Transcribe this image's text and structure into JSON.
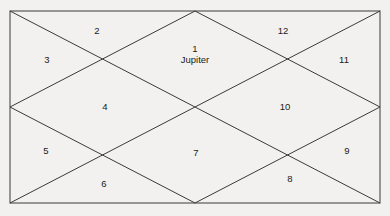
{
  "chart": {
    "type": "north-indian-vedic-birth-chart",
    "title": "",
    "background_color": "#f2f1ef",
    "line_color": "#3a3a3a",
    "text_color": "#1a1a1a",
    "frame": {
      "x1": 10,
      "y1": 11,
      "x2": 380,
      "y2": 203
    },
    "center": {
      "x": 195,
      "y": 107
    },
    "houses": [
      {
        "number": "1",
        "planets": "Jupiter",
        "label_x": 195,
        "label_y": 54
      },
      {
        "number": "2",
        "planets": "",
        "label_x": 97,
        "label_y": 30
      },
      {
        "number": "3",
        "planets": "",
        "label_x": 47,
        "label_y": 59
      },
      {
        "number": "4",
        "planets": "",
        "label_x": 105,
        "label_y": 106
      },
      {
        "number": "5",
        "planets": "",
        "label_x": 46,
        "label_y": 150
      },
      {
        "number": "6",
        "planets": "",
        "label_x": 104,
        "label_y": 183
      },
      {
        "number": "7",
        "planets": "",
        "label_x": 196,
        "label_y": 152
      },
      {
        "number": "8",
        "planets": "",
        "label_x": 290,
        "label_y": 178
      },
      {
        "number": "9",
        "planets": "",
        "label_x": 347,
        "label_y": 150
      },
      {
        "number": "10",
        "planets": "",
        "label_x": 285,
        "label_y": 106
      },
      {
        "number": "11",
        "planets": "",
        "label_x": 344,
        "label_y": 59
      },
      {
        "number": "12",
        "planets": "",
        "label_x": 283,
        "label_y": 30
      }
    ]
  }
}
